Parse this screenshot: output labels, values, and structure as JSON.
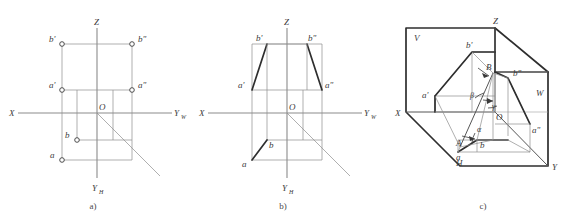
{
  "figure": {
    "panels": [
      {
        "id": "a",
        "caption": "a)",
        "axis_labels": {
          "x": "X",
          "z": "Z",
          "yw": "Y",
          "yw_sub": "W",
          "yh": "Y",
          "yh_sub": "H",
          "origin": "O"
        },
        "points": [
          {
            "name": "b'",
            "label": "b'"
          },
          {
            "name": "b''",
            "label": "b\""
          },
          {
            "name": "a'",
            "label": "a'"
          },
          {
            "name": "a''",
            "label": "a\""
          },
          {
            "name": "b",
            "label": "b"
          },
          {
            "name": "a",
            "label": "a"
          }
        ]
      },
      {
        "id": "b",
        "caption": "b)",
        "axis_labels": {
          "x": "X",
          "z": "Z",
          "yw": "Y",
          "yw_sub": "W",
          "yh": "Y",
          "yh_sub": "H",
          "origin": "O"
        },
        "points": [
          {
            "name": "b'",
            "label": "b'"
          },
          {
            "name": "b''",
            "label": "b\""
          },
          {
            "name": "a'",
            "label": "a'"
          },
          {
            "name": "a''",
            "label": "a\""
          },
          {
            "name": "b",
            "label": "b"
          },
          {
            "name": "a",
            "label": "a"
          }
        ]
      },
      {
        "id": "c",
        "caption": "c)",
        "axis_labels": {
          "x": "X",
          "z": "Z",
          "y": "Y",
          "origin": "O"
        },
        "plane_labels": {
          "v": "V",
          "h": "H",
          "w": "W"
        },
        "points": [
          {
            "name": "b'",
            "label": "b'"
          },
          {
            "name": "b''",
            "label": "b\""
          },
          {
            "name": "a'",
            "label": "a'"
          },
          {
            "name": "a''",
            "label": "a\""
          },
          {
            "name": "b",
            "label": "b"
          },
          {
            "name": "a",
            "label": "a"
          },
          {
            "name": "A",
            "label": "A"
          },
          {
            "name": "B",
            "label": "B"
          }
        ],
        "angles": [
          {
            "name": "alpha",
            "label": "α"
          },
          {
            "name": "beta",
            "label": "β"
          },
          {
            "name": "gamma",
            "label": "γ"
          }
        ]
      }
    ]
  },
  "colors": {
    "axis": "#8b8b8b",
    "thin": "#8d8d8d",
    "bold": "#2e2e2e",
    "text": "#3b3b3b",
    "background": "#ffffff"
  }
}
